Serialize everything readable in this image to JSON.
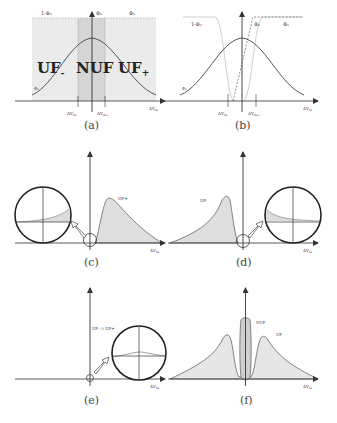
{
  "figure": {
    "panels": [
      {
        "id": "a",
        "caption": "(a)",
        "labels": {
          "one_minus_phi": "1-Φ₁",
          "phi2": "Φ₂",
          "phi1": "Φ₁",
          "phi_curve": "Φ₁",
          "uf_minus": "UF",
          "uf_minus_sub": "-",
          "nuf": "NUF",
          "uf_plus": "UF",
          "uf_plus_sub": "+",
          "th_minus": "ΔV",
          "th_minus_sub": "th-",
          "th_plus": "ΔV",
          "th_plus_sub": "th+",
          "xaxis": "ΔV",
          "xaxis_sub": "th"
        }
      },
      {
        "id": "b",
        "caption": "(b)",
        "labels": {
          "one_minus_phi": "1-Φ₁",
          "phi2": "Φ₂",
          "phi1": "Φ₁",
          "phi_curve": "Φ₁",
          "th_minus": "ΔV",
          "th_minus_sub": "th-",
          "th_plus": "ΔV",
          "th_plus_sub": "th+",
          "xaxis": "ΔV",
          "xaxis_sub": "th"
        }
      },
      {
        "id": "c",
        "caption": "(c)",
        "labels": {
          "curve": "UF+",
          "xaxis": "ΔV",
          "xaxis_sub": "th"
        }
      },
      {
        "id": "d",
        "caption": "(d)",
        "labels": {
          "curve": "UF-",
          "xaxis": "ΔV",
          "xaxis_sub": "th"
        }
      },
      {
        "id": "e",
        "caption": "(e)",
        "labels": {
          "curve": "UF- ∩ UF+",
          "xaxis": "ΔV",
          "xaxis_sub": "th"
        }
      },
      {
        "id": "f",
        "caption": "(f)",
        "labels": {
          "nuf": "NUF",
          "uf": "UF",
          "xaxis": "ΔV",
          "xaxis_sub": "th"
        }
      }
    ],
    "colors": {
      "axis": "#333333",
      "curve": "#555555",
      "fill_light": "#e6e6e6",
      "fill_band": "#d4d4d4",
      "fill_mid": "#cfcfcf",
      "light_curve": "#c8c8c8"
    }
  }
}
